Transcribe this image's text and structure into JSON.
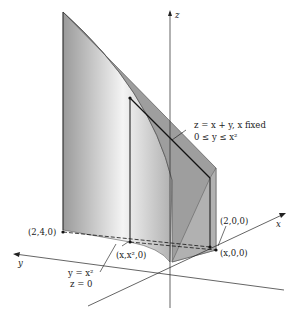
{
  "figure": {
    "axes": {
      "x": "x",
      "y": "y",
      "z": "z"
    },
    "labels": {
      "surface_line1": "z = x + y,   x fixed",
      "surface_line2": "0 ≤ y ≤ x²",
      "point_200": "(2,0,0)",
      "point_240": "(2,4,0)",
      "point_x00": "(x,0,0)",
      "point_xx20": "(x,x²,0)",
      "curve_line1": "y = x²",
      "curve_line2": "z = 0"
    },
    "colors": {
      "surface_dark": "#8a8a8a",
      "surface_light": "#e6e6e6",
      "line": "#111111"
    }
  }
}
